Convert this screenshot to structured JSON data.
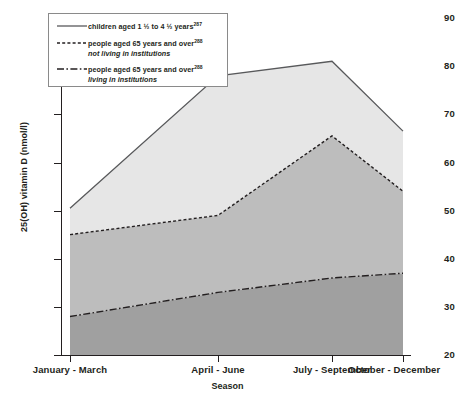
{
  "chart_data": {
    "type": "area",
    "title": "",
    "xlabel": "Season",
    "ylabel": "25(OH) vitamin D (nmol/l)",
    "categories": [
      "January - March",
      "April - June",
      "July - September",
      "October - December"
    ],
    "ylim": [
      20,
      90
    ],
    "yticks": [
      20,
      30,
      40,
      50,
      60,
      70,
      80,
      90
    ],
    "grid": false,
    "legend_position": "top-left",
    "series": [
      {
        "name": "children aged 1 1/2 to 4 1/2 years",
        "footnote": "287",
        "line_style": "solid",
        "fill_color": "#e6e6e6",
        "line_color": "#58595b",
        "values": [
          50.5,
          78.0,
          81.0,
          66.5
        ]
      },
      {
        "name": "people aged 65 years and over not living in institutions",
        "footnote": "288",
        "line_style": "dotted",
        "fill_color": "#bdbdbd",
        "line_color": "#231f20",
        "values": [
          45.0,
          49.0,
          65.5,
          54.0
        ]
      },
      {
        "name": "people aged 65 years and over living in institutions",
        "footnote": "288",
        "line_style": "dash-dot",
        "fill_color": "#a0a0a0",
        "line_color": "#231f20",
        "values": [
          28.0,
          33.0,
          36.0,
          37.0
        ]
      }
    ]
  },
  "axis": {
    "y_tick_labels": [
      "20",
      "30",
      "40",
      "50",
      "60",
      "70",
      "80",
      "90"
    ],
    "x_tick_labels": [
      "January - March",
      "April - June",
      "July - September",
      "October - December"
    ],
    "y_title": "25(OH) vitamin D (nmol/l)",
    "x_title": "Season"
  },
  "legend": {
    "items": [
      {
        "key": "solid-line-key",
        "line1_pre": "children aged 1 ",
        "line1_frac1": "1/2",
        "line1_mid": " to 4 ",
        "line1_frac2": "1/2",
        "line1_post": " years",
        "sup": "287",
        "line2": ""
      },
      {
        "key": "dotted-line-key",
        "line1_pre": "people aged 65 years and over",
        "line1_frac1": "",
        "line1_mid": "",
        "line1_frac2": "",
        "line1_post": "",
        "sup": "288",
        "line2": "not living in institutions"
      },
      {
        "key": "dash-dot-line-key",
        "line1_pre": "people aged 65 years and over",
        "line1_frac1": "",
        "line1_mid": "",
        "line1_frac2": "",
        "line1_post": "",
        "sup": "288",
        "line2": "living in institutions"
      }
    ]
  },
  "colors": {
    "band_top": "#e6e6e6",
    "band_mid": "#bdbdbd",
    "band_low": "#a0a0a0",
    "axis": "#231f20",
    "legend_border": "#8a8a8a"
  }
}
